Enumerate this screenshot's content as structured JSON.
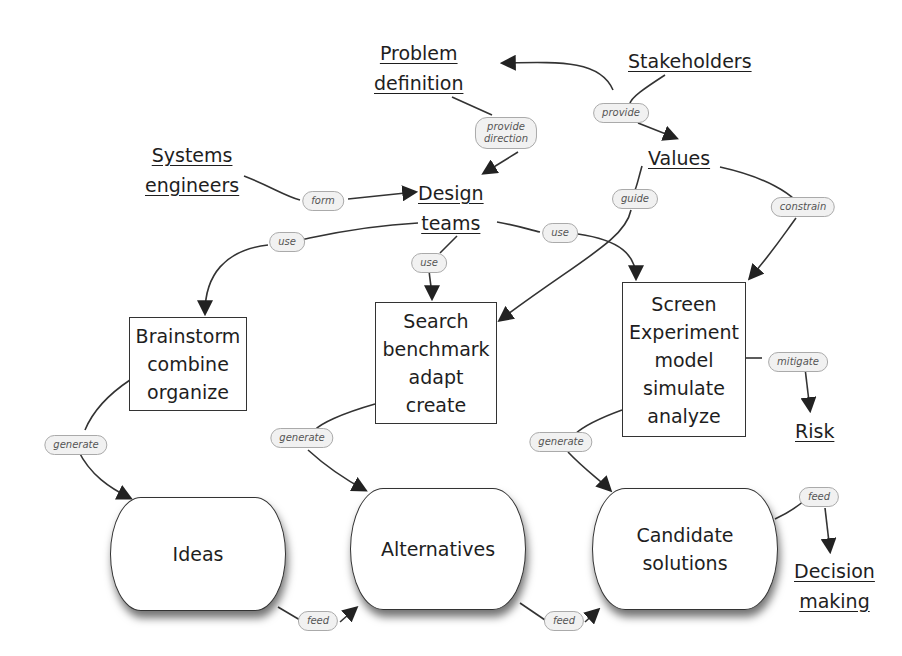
{
  "concepts": {
    "problem_definition": [
      "Problem",
      "definition"
    ],
    "stakeholders": "Stakeholders",
    "systems_engineers": [
      "Systems",
      "engineers"
    ],
    "design_teams": [
      "Design",
      "teams"
    ],
    "values": "Values",
    "risk": "Risk",
    "decision_making": [
      "Decision",
      "making"
    ]
  },
  "activities": {
    "brainstorm": [
      "Brainstorm",
      "combine",
      "organize"
    ],
    "search": [
      "Search",
      "benchmark",
      "adapt",
      "create"
    ],
    "screen": [
      "Screen",
      "Experiment",
      "model",
      "simulate",
      "analyze"
    ]
  },
  "outputs": {
    "ideas": "Ideas",
    "alternatives": "Alternatives",
    "candidate_solutions": [
      "Candidate",
      "solutions"
    ]
  },
  "link_labels": {
    "provide_direction": [
      "provide",
      "direction"
    ],
    "provide": "provide",
    "form": "form",
    "guide": "guide",
    "constrain": "constrain",
    "use_left": "use",
    "use_center": "use",
    "use_right": "use",
    "mitigate": "mitigate",
    "generate_ideas": "generate",
    "generate_alternatives": "generate",
    "generate_candidates": "generate",
    "feed_ideas": "feed",
    "feed_alternatives": "feed",
    "feed_decision": "feed"
  },
  "colors": {
    "line": "#333333",
    "cloud_fill": "#f1f1f1",
    "text": "#1e1e1e"
  }
}
